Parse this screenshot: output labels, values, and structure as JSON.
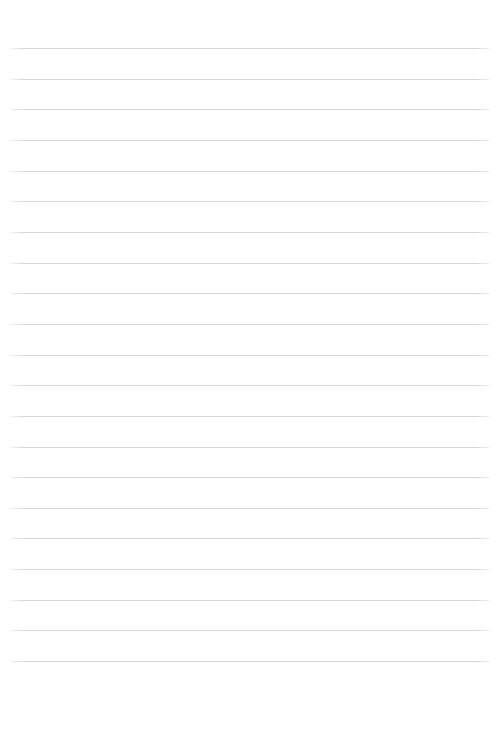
{
  "document": {
    "type": "lined-paper",
    "title": "Blank Lined Paper",
    "page_width": 501,
    "page_height": 745,
    "background_color": "#ffffff",
    "content_text": "",
    "has_header": false,
    "has_footer": false,
    "has_margin_rule": false
  },
  "ruling": {
    "line_color": "#d5d5d5",
    "line_thickness": 1,
    "line_count": 21,
    "line_spacing": 30.65,
    "first_line_y": 48,
    "last_line_y": 661,
    "line_start_x": 11,
    "line_end_x": 490,
    "line_length": 479,
    "lines_y": [
      48,
      78.7,
      109.3,
      140,
      170.6,
      201.3,
      231.9,
      262.6,
      293.2,
      323.9,
      354.5,
      385.2,
      415.8,
      446.5,
      477.1,
      507.8,
      538.4,
      569.1,
      599.7,
      630.4,
      661
    ]
  },
  "margins": {
    "top": 48,
    "bottom": 84,
    "left": 11,
    "right": 11
  }
}
